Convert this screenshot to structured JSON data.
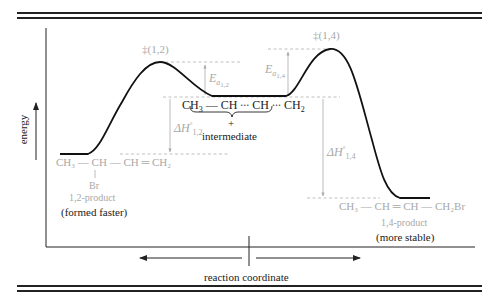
{
  "diagram": {
    "type": "reaction-energy-profile",
    "axes": {
      "y_label": "energy",
      "x_label": "reaction coordinate"
    },
    "transition_states": [
      {
        "id": "ts12",
        "label": "‡(1,2)"
      },
      {
        "id": "ts14",
        "label": "‡(1,4)"
      }
    ],
    "energy_labels": {
      "ea12": {
        "main": "E",
        "sub": "a",
        "subsub": "1,2"
      },
      "ea14": {
        "main": "E",
        "sub": "a",
        "subsub": "1,4"
      },
      "dh12": {
        "main": "ΔH",
        "sup": "°",
        "sub": "1,2"
      },
      "dh14": {
        "main": "ΔH",
        "sup": "°",
        "sub": "1,4"
      }
    },
    "intermediate": {
      "formula_parts": [
        "CH",
        "3",
        " — CH",
        " ∙∙∙ ",
        "CH",
        " ∙∙∙ ",
        "CH",
        "2"
      ],
      "charge": "+",
      "label": "intermediate"
    },
    "product_12": {
      "formula": "CH₃ — CH — CH ═ CH₂",
      "substituent": "Br",
      "name": "1,2-product",
      "note": "(formed faster)"
    },
    "product_14": {
      "formula": "CH₃ — CH ═ CH — CH₂Br",
      "name": "1,4-product",
      "note": "(more stable)"
    },
    "colors": {
      "curve": "#111111",
      "label_gray": "#a8a8a8",
      "dashed": "#b0b0b0",
      "rules": "#222222"
    }
  }
}
